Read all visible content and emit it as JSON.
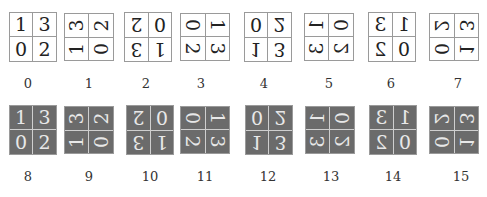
{
  "figure": {
    "base_grid": {
      "tl": "1",
      "tr": "3",
      "bl": "0",
      "br": "2"
    },
    "transforms": [
      "identity",
      "rot-ccw",
      "rot-180",
      "rot-cw",
      "flip-v",
      "anti-diag",
      "flip-h",
      "main-diag"
    ],
    "rows": [
      {
        "style": "light",
        "items": [
          {
            "label": "0",
            "transform": "identity"
          },
          {
            "label": "1",
            "transform": "rot-ccw"
          },
          {
            "label": "2",
            "transform": "rot-180"
          },
          {
            "label": "3",
            "transform": "rot-cw"
          },
          {
            "label": "4",
            "transform": "flip-v"
          },
          {
            "label": "5",
            "transform": "anti-diag"
          },
          {
            "label": "6",
            "transform": "flip-h"
          },
          {
            "label": "7",
            "transform": "main-diag"
          }
        ]
      },
      {
        "style": "dark",
        "items": [
          {
            "label": "8",
            "transform": "identity"
          },
          {
            "label": "9",
            "transform": "rot-ccw"
          },
          {
            "label": "10",
            "transform": "rot-180"
          },
          {
            "label": "11",
            "transform": "rot-cw"
          },
          {
            "label": "12",
            "transform": "flip-v"
          },
          {
            "label": "13",
            "transform": "anti-diag"
          },
          {
            "label": "14",
            "transform": "flip-h"
          },
          {
            "label": "15",
            "transform": "main-diag"
          }
        ]
      }
    ],
    "colors": {
      "light_fill": "#ffffff",
      "dark_fill": "#6b6b6b",
      "border": "#9a9a9a",
      "dark_divider": "#cfcfcf"
    }
  }
}
